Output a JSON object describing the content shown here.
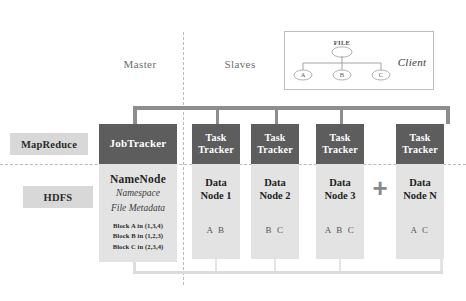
{
  "diagram": {
    "colors": {
      "tracker_fill": "#5d5d5d",
      "node_fill": "#e3e3e3",
      "layer_tag_fill": "#d8d8d8",
      "bus_top": "#8d8d8d",
      "bus_bottom": "#dcdcdc",
      "divider": "#b9b9b9",
      "text_light": "#ffffff",
      "text_dark": "#1f1f1f"
    }
  },
  "columns": {
    "master_label": "Master",
    "slaves_label": "Slaves"
  },
  "layers": [
    {
      "id": "mapreduce",
      "label": "MapReduce"
    },
    {
      "id": "hdfs",
      "label": "HDFS"
    }
  ],
  "client": {
    "label": "Client",
    "file_label": "FILE",
    "blocks": [
      {
        "letter": "A"
      },
      {
        "letter": "B"
      },
      {
        "letter": "C"
      }
    ]
  },
  "master": {
    "jobtracker": {
      "label": "JobTracker"
    },
    "namenode": {
      "title": "NameNode",
      "subtitles": [
        "Namespace",
        "File Metadata"
      ],
      "blocks": [
        "Block A in (1,3,4)",
        "Block B in (1,2,3)",
        "Block C in (2,3,4)"
      ]
    }
  },
  "slaves": {
    "tracker_label_line1": "Task",
    "tracker_label_line2": "Tracker",
    "plus_symbol": "+",
    "nodes": [
      {
        "id": "datanode-1",
        "tracker_line1": "Task",
        "tracker_line2": "Tracker",
        "title_line1": "Data",
        "title_line2": "Node 1",
        "blocks": "A B"
      },
      {
        "id": "datanode-2",
        "tracker_line1": "Task",
        "tracker_line2": "Tracker",
        "title_line1": "Data",
        "title_line2": "Node 2",
        "blocks": "B C"
      },
      {
        "id": "datanode-3",
        "tracker_line1": "Task",
        "tracker_line2": "Tracker",
        "title_line1": "Data",
        "title_line2": "Node 3",
        "blocks": "A B C"
      },
      {
        "id": "datanode-n",
        "tracker_line1": "Task",
        "tracker_line2": "Tracker",
        "title_line1": "Data",
        "title_line2": "Node N",
        "blocks": "A C"
      }
    ]
  }
}
